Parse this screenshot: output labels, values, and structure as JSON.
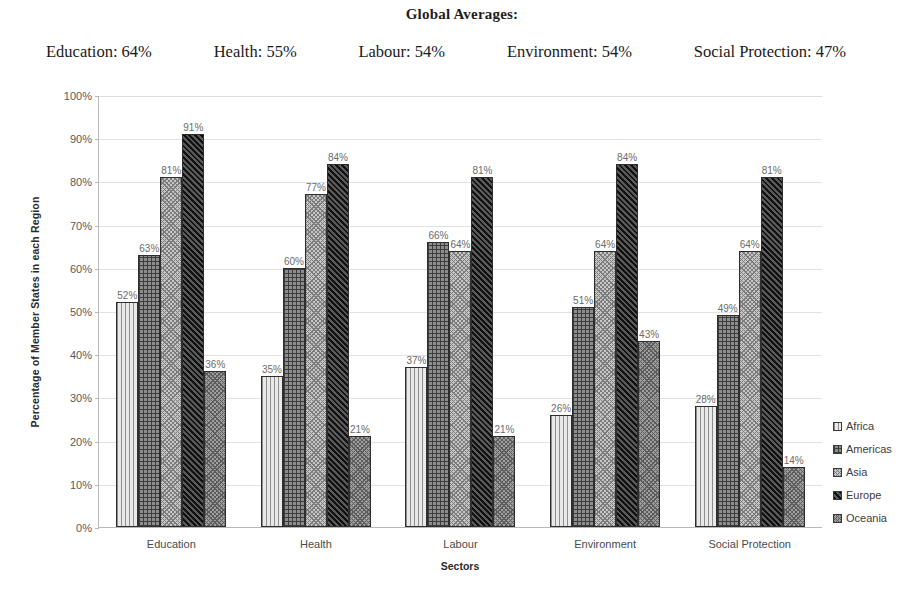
{
  "header": {
    "title": "Global Averages:",
    "averages": [
      {
        "label": "Education: 64%"
      },
      {
        "label": "Health: 55%"
      },
      {
        "label": "Labour: 54%"
      },
      {
        "label": "Environment: 54%"
      },
      {
        "label": "Social Protection: 47%"
      }
    ]
  },
  "chart_data": {
    "type": "bar",
    "title": "Global Averages:",
    "xlabel": "Sectors",
    "ylabel": "Percentage of Member States in each Region",
    "ylim": [
      0,
      100
    ],
    "ytick_labels": [
      "100%",
      "90%",
      "80%",
      "70%",
      "60%",
      "50%",
      "40%",
      "30%",
      "20%",
      "10%",
      "0%"
    ],
    "yticks": [
      100,
      90,
      80,
      70,
      60,
      50,
      40,
      30,
      20,
      10,
      0
    ],
    "grid": true,
    "legend_position": "right",
    "categories": [
      "Education",
      "Health",
      "Labour",
      "Environment",
      "Social Protection"
    ],
    "series": [
      {
        "name": "Africa",
        "pattern": "vertical-lines",
        "color": "#e9e9e9",
        "values": [
          52,
          35,
          37,
          26,
          28
        ],
        "labels": [
          "52%",
          "35%",
          "37%",
          "26%",
          "28%"
        ]
      },
      {
        "name": "Americas",
        "pattern": "grid",
        "color": "#8d8d8d",
        "values": [
          63,
          60,
          66,
          51,
          49
        ],
        "labels": [
          "63%",
          "60%",
          "66%",
          "51%",
          "49%"
        ]
      },
      {
        "name": "Asia",
        "pattern": "small-checker",
        "color": "#c6c6c6",
        "values": [
          81,
          77,
          64,
          64,
          64
        ],
        "labels": [
          "81%",
          "77%",
          "64%",
          "64%",
          "64%"
        ]
      },
      {
        "name": "Europe",
        "pattern": "dark-diagonal",
        "color": "#2f2f2f",
        "values": [
          91,
          84,
          81,
          84,
          81
        ],
        "labels": [
          "91%",
          "84%",
          "81%",
          "84%",
          "81%"
        ]
      },
      {
        "name": "Oceania",
        "pattern": "medium-checker",
        "color": "#9e9e9e",
        "values": [
          36,
          21,
          21,
          43,
          14
        ],
        "labels": [
          "36%",
          "21%",
          "21%",
          "43%",
          "14%"
        ]
      }
    ],
    "global_averages": {
      "Education": 64,
      "Health": 55,
      "Labour": 54,
      "Environment": 54,
      "Social Protection": 47
    }
  },
  "legend": {
    "items": [
      {
        "label": "Africa"
      },
      {
        "label": "Americas"
      },
      {
        "label": "Asia"
      },
      {
        "label": "Europe"
      },
      {
        "label": "Oceania"
      }
    ]
  }
}
